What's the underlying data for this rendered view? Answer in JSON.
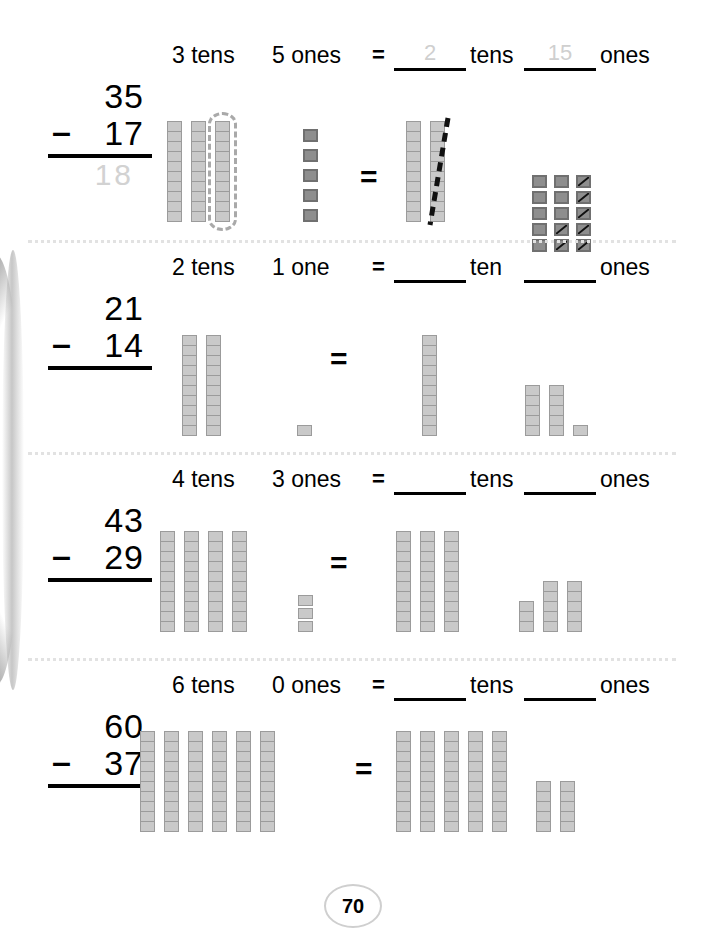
{
  "page": {
    "number": "70",
    "background": "#ffffff",
    "block_color": "#c9c9c9",
    "dark_block_color": "#8e8e8e",
    "traced_answer_color": "#cfcfcf"
  },
  "rows": [
    {
      "problem": {
        "minuend": "35",
        "minus": "–",
        "subtrahend": "17",
        "answer": "18",
        "answer_traced": true
      },
      "header": {
        "tens_label": "3 tens",
        "ones_label": "5 ones",
        "equals": "=",
        "answer_tens": "2",
        "answer_tens_traced": true,
        "tens_word": "tens",
        "answer_ones": "15",
        "answer_ones_traced": true,
        "ones_word": "ones"
      },
      "left": {
        "rods": 3,
        "rod_cells": 10,
        "circled_rod_index": 3,
        "ones": 5,
        "ones_dark": true
      },
      "right": {
        "rods": 2,
        "rod_cells": 10,
        "struck_rod_index": 2,
        "ones_grid_cols": 3,
        "ones_grid_rows": 5,
        "ones_total": 15,
        "ones_struck": 7,
        "ones_dark": true
      }
    },
    {
      "problem": {
        "minuend": "21",
        "minus": "–",
        "subtrahend": "14",
        "answer": "",
        "answer_traced": false
      },
      "header": {
        "tens_label": "2 tens",
        "ones_label": "1 one",
        "equals": "=",
        "answer_tens": "",
        "answer_tens_traced": false,
        "tens_word": "ten",
        "answer_ones": "",
        "answer_ones_traced": false,
        "ones_word": "ones"
      },
      "left": {
        "rods": 2,
        "rod_cells": 10,
        "circled_rod_index": 0,
        "ones": 1,
        "ones_dark": false
      },
      "right": {
        "rods": 1,
        "rod_cells": 10,
        "struck_rod_index": 0,
        "ones_stacks": [
          5,
          5,
          1
        ],
        "ones_total": 11,
        "ones_dark": false
      }
    },
    {
      "problem": {
        "minuend": "43",
        "minus": "–",
        "subtrahend": "29",
        "answer": "",
        "answer_traced": false
      },
      "header": {
        "tens_label": "4 tens",
        "ones_label": "3 ones",
        "equals": "=",
        "answer_tens": "",
        "answer_tens_traced": false,
        "tens_word": "tens",
        "answer_ones": "",
        "answer_ones_traced": false,
        "ones_word": "ones"
      },
      "left": {
        "rods": 4,
        "rod_cells": 10,
        "circled_rod_index": 0,
        "ones": 3,
        "ones_dark": false
      },
      "right": {
        "rods": 3,
        "rod_cells": 10,
        "struck_rod_index": 0,
        "ones_stacks": [
          3,
          5,
          5
        ],
        "ones_total": 13,
        "ones_dark": false
      }
    },
    {
      "problem": {
        "minuend": "60",
        "minus": "–",
        "subtrahend": "37",
        "answer": "",
        "answer_traced": false
      },
      "header": {
        "tens_label": "6 tens",
        "ones_label": "0 ones",
        "equals": "=",
        "answer_tens": "",
        "answer_tens_traced": false,
        "tens_word": "tens",
        "answer_ones": "",
        "answer_ones_traced": false,
        "ones_word": "ones"
      },
      "left": {
        "rods": 6,
        "rod_cells": 10,
        "circled_rod_index": 0,
        "ones": 0,
        "ones_dark": false
      },
      "right": {
        "rods": 5,
        "rod_cells": 10,
        "struck_rod_index": 0,
        "ones_stacks": [
          5,
          5
        ],
        "ones_total": 10,
        "ones_dark": false
      }
    }
  ]
}
